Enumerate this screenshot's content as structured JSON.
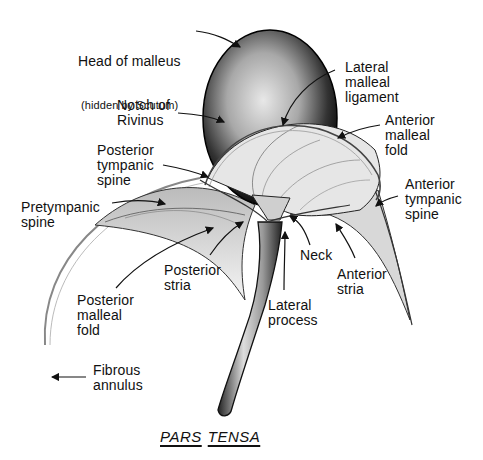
{
  "figure": {
    "caption_words": [
      "PARS",
      "TENSA"
    ]
  },
  "labels": {
    "head_of_malleus": {
      "line1": "Head of malleus",
      "line2": "(hidden by Scutum)"
    },
    "lateral_malleal_ligament": {
      "text": "Lateral\nmalleal\nligament"
    },
    "notch_of_rivinus": {
      "text": "Notch of\nRivinus"
    },
    "anterior_malleal_fold": {
      "text": "Anterior\nmalleal\nfold"
    },
    "posterior_tympanic_spine": {
      "text": "Posterior\ntympanic\nspine"
    },
    "anterior_tympanic_spine": {
      "text": "Anterior\ntympanic\nspine"
    },
    "pretympanic_spine": {
      "text": "Pretympanic\nspine"
    },
    "posterior_stria": {
      "text": "Posterior\nstria"
    },
    "neck": {
      "text": "Neck"
    },
    "anterior_stria": {
      "text": "Anterior\nstria"
    },
    "posterior_malleal_fold": {
      "text": "Posterior\nmalleal\nfold"
    },
    "lateral_process": {
      "text": "Lateral\nprocess"
    },
    "fibrous_annulus": {
      "text": "Fibrous\nannulus"
    }
  },
  "colors": {
    "ink": "#111111",
    "background": "#ffffff",
    "shade": "#555555"
  }
}
